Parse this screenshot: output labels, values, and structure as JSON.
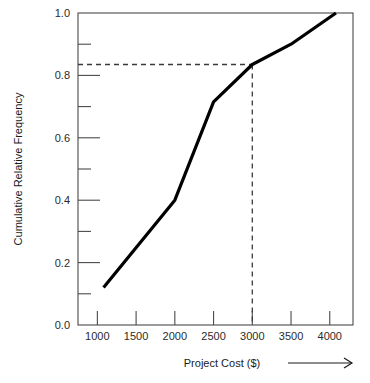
{
  "chart_data": {
    "type": "line",
    "title": "",
    "subtitle": "",
    "xlabel": "Project Cost ($)",
    "ylabel": "Cumulative Relative Frequency",
    "xlim": [
      750,
      4300
    ],
    "ylim": [
      0.0,
      1.0
    ],
    "grid": false,
    "legend": null,
    "x_ticks": [
      1000,
      1500,
      2000,
      2500,
      3000,
      3500,
      4000
    ],
    "x_tick_labels": [
      "1000",
      "1500",
      "2000",
      "2500",
      "3000",
      "3500",
      "4000"
    ],
    "y_ticks_major": [
      0.0,
      0.2,
      0.4,
      0.6,
      0.8,
      1.0
    ],
    "y_tick_labels": [
      "0.0",
      "0.2",
      "0.4",
      "0.6",
      "0.8",
      "1.0"
    ],
    "y_ticks_minor": [
      0.1,
      0.3,
      0.5,
      0.7,
      0.9
    ],
    "series": [
      {
        "name": "Cumulative relative frequency of project cost",
        "x": [
          1080,
          2000,
          2500,
          3000,
          3500,
          4080
        ],
        "y": [
          0.12,
          0.4,
          0.715,
          0.835,
          0.9,
          1.0
        ]
      }
    ],
    "annotations": [
      {
        "name": "percentile-guide",
        "type": "dashed-crosshair",
        "x": 3000,
        "y": 0.835,
        "label": ""
      },
      {
        "name": "x-axis-direction-arrow",
        "type": "arrow",
        "label": ""
      }
    ]
  },
  "axes": {
    "x_title": "Project Cost ($)",
    "y_title": "Cumulative Relative Frequency"
  }
}
